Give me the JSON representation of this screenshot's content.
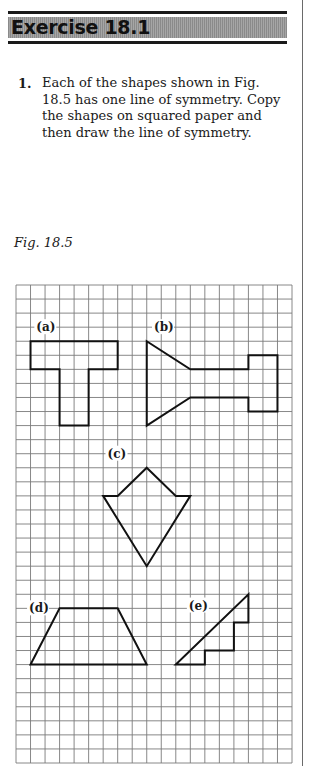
{
  "header": {
    "title": "Exercise 18.1"
  },
  "question": {
    "number": "1.",
    "text": "Each of the shapes shown in Fig. 18.5 has one line of symmetry. Copy the shapes on squared paper and then draw the line of symmetry."
  },
  "figure": {
    "caption": "Fig. 18.5",
    "grid": {
      "columns": 19,
      "rows": 34
    },
    "shapes": [
      {
        "label": "(a)",
        "points": [
          [
            1,
            4
          ],
          [
            7,
            4
          ],
          [
            7,
            6
          ],
          [
            5,
            6
          ],
          [
            5,
            10
          ],
          [
            3,
            10
          ],
          [
            3,
            6
          ],
          [
            1,
            6
          ]
        ],
        "label_at": [
          1.4,
          3
        ]
      },
      {
        "label": "(b)",
        "points": [
          [
            9,
            4
          ],
          [
            12,
            6
          ],
          [
            16,
            6
          ],
          [
            16,
            5
          ],
          [
            18,
            5
          ],
          [
            18,
            9
          ],
          [
            16,
            9
          ],
          [
            16,
            8
          ],
          [
            12,
            8
          ],
          [
            9,
            10
          ]
        ],
        "label_at": [
          9.5,
          3
        ]
      },
      {
        "label": "(c)",
        "points": [
          [
            9,
            13
          ],
          [
            11,
            15
          ],
          [
            12,
            15
          ],
          [
            9,
            20
          ],
          [
            6,
            15
          ],
          [
            7,
            15
          ]
        ],
        "label_at": [
          6.3,
          12
        ]
      },
      {
        "label": "(d)",
        "points": [
          [
            3,
            23
          ],
          [
            7,
            23
          ],
          [
            9,
            27
          ],
          [
            1,
            27
          ]
        ],
        "label_at": [
          0.9,
          23
        ]
      },
      {
        "label": "(e)",
        "points": [
          [
            16,
            22
          ],
          [
            16,
            24
          ],
          [
            15,
            24
          ],
          [
            15,
            26
          ],
          [
            13,
            26
          ],
          [
            13,
            27
          ],
          [
            11,
            27
          ]
        ],
        "label_at": [
          11.9,
          22.8
        ]
      }
    ]
  }
}
